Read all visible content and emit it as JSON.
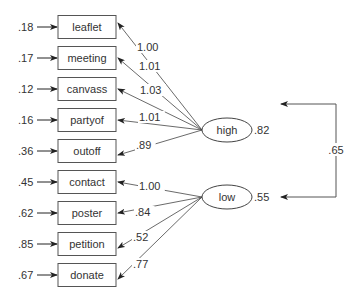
{
  "diagram": {
    "type": "structural-equation-model",
    "indicators": [
      {
        "name": "leaflet",
        "error": ".18",
        "loading": "1.00",
        "factor": "high"
      },
      {
        "name": "meeting",
        "error": ".17",
        "loading": "1.01",
        "factor": "high"
      },
      {
        "name": "canvass",
        "error": ".12",
        "loading": "1.03",
        "factor": "high"
      },
      {
        "name": "partyof",
        "error": ".16",
        "loading": "1.01",
        "factor": "high"
      },
      {
        "name": "outoff",
        "error": ".36",
        "loading": ".89",
        "factor": "high"
      },
      {
        "name": "contact",
        "error": ".45",
        "loading": "1.00",
        "factor": "low"
      },
      {
        "name": "poster",
        "error": ".62",
        "loading": ".84",
        "factor": "low"
      },
      {
        "name": "petition",
        "error": ".85",
        "loading": ".52",
        "factor": "low"
      },
      {
        "name": "donate",
        "error": ".67",
        "loading": ".77",
        "factor": "low"
      }
    ],
    "factors": [
      {
        "name": "high",
        "variance": ".82"
      },
      {
        "name": "low",
        "variance": ".55"
      }
    ],
    "covariance": {
      "between": [
        "high",
        "low"
      ],
      "value": ".65"
    }
  }
}
